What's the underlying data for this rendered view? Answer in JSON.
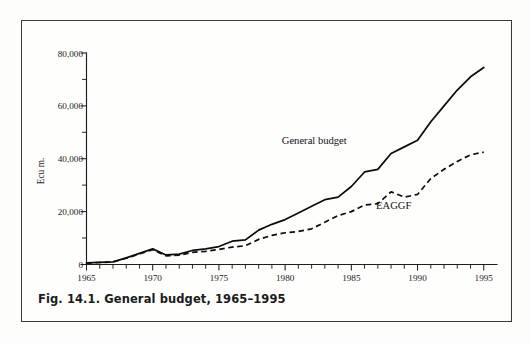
{
  "figure": {
    "caption": "Fig. 14.1.  General budget, 1965–1995",
    "background_color": "#fdfdfc",
    "frame_color": "#3a3a3a",
    "ink_color": "#0c0c0c"
  },
  "chart_data": {
    "type": "line",
    "title": "General budget, 1965–1995",
    "xlabel": "",
    "ylabel": "Ecu m.",
    "xlim": [
      1965,
      1996
    ],
    "ylim": [
      0,
      80000
    ],
    "grid": false,
    "legend": "inline-annotation",
    "x_major_ticks": [
      1965,
      1970,
      1975,
      1980,
      1985,
      1990,
      1995
    ],
    "x_major_tick_labels": [
      "1965",
      "1970",
      "1975",
      "1980",
      "1985",
      "1990",
      "1995"
    ],
    "x_minor_tick_step": 1,
    "y_major_ticks": [
      0,
      20000,
      40000,
      60000,
      80000
    ],
    "y_major_tick_labels": [
      "0",
      "20,000",
      "40,000",
      "60,000",
      "80,000"
    ],
    "y_minor_ticks": [
      10000,
      30000,
      50000,
      70000
    ],
    "x": [
      1965,
      1966,
      1967,
      1968,
      1969,
      1970,
      1971,
      1972,
      1973,
      1974,
      1975,
      1976,
      1977,
      1978,
      1979,
      1980,
      1981,
      1982,
      1983,
      1984,
      1985,
      1986,
      1987,
      1988,
      1989,
      1990,
      1991,
      1992,
      1993,
      1994,
      1995
    ],
    "series": [
      {
        "name": "General budget",
        "style": "solid",
        "label_position": {
          "x": 1982.2,
          "y": 45500
        },
        "values": [
          600,
          800,
          1000,
          2500,
          4200,
          5900,
          3600,
          3900,
          5300,
          5900,
          6800,
          8800,
          9300,
          13000,
          15200,
          17000,
          19500,
          22000,
          24500,
          25500,
          29500,
          35000,
          36000,
          42000,
          44500,
          47000,
          54000,
          60000,
          66000,
          71000,
          74500
        ]
      },
      {
        "name": "EAGGF",
        "style": "dashed",
        "label_position": {
          "x": 1988.2,
          "y": 21000
        },
        "values": [
          550,
          750,
          950,
          2400,
          4000,
          5600,
          3300,
          3500,
          4600,
          5000,
          5700,
          6600,
          7100,
          9500,
          11000,
          12000,
          12500,
          13500,
          16000,
          18500,
          20000,
          22500,
          23000,
          27500,
          25500,
          26500,
          32500,
          36000,
          39000,
          41500,
          42500
        ]
      }
    ]
  }
}
